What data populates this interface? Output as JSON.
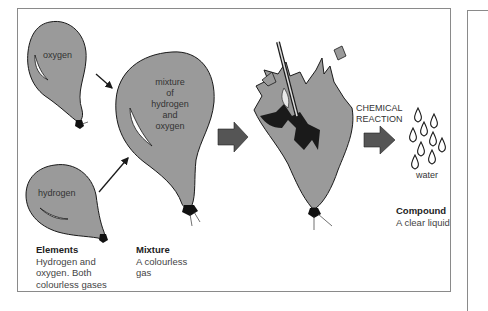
{
  "diagram": {
    "balloons": {
      "oxygen": {
        "label": "oxygen"
      },
      "hydrogen": {
        "label": "hydrogen"
      },
      "mixture": {
        "lines": [
          "mixture",
          "of",
          "hydrogen",
          "and",
          "oxygen"
        ]
      }
    },
    "reaction": {
      "lines": [
        "CHEMICAL",
        "REACTION"
      ]
    },
    "product": {
      "label": "water"
    },
    "captions": {
      "elements": {
        "title": "Elements",
        "lines": [
          "Hydrogen and",
          "oxygen. Both",
          "colourless gases"
        ]
      },
      "mixture": {
        "title": "Mixture",
        "lines": [
          "A colourless",
          "gas"
        ]
      },
      "compound": {
        "title": "Compound",
        "lines": [
          "A clear liquid"
        ]
      }
    },
    "colors": {
      "balloon_fill": "#9a9a9a",
      "outline": "#1a1a1a",
      "arrow_fill": "#555555",
      "border": "#8a8a8a"
    }
  }
}
